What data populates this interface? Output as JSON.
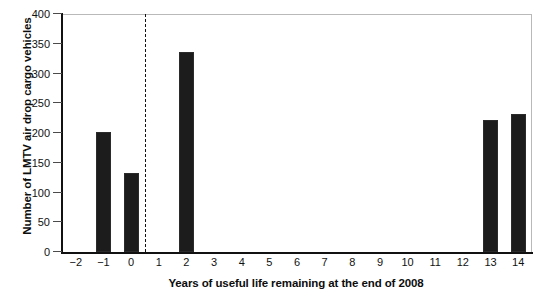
{
  "chart_data": {
    "type": "bar",
    "title": "",
    "xlabel": "Years of useful life remaining at the end of 2008",
    "ylabel": "Number of LMTV air drop cargo vehicles",
    "categories": [
      "-2",
      "-1",
      "0",
      "1",
      "2",
      "3",
      "4",
      "5",
      "6",
      "7",
      "8",
      "9",
      "10",
      "11",
      "12",
      "13",
      "14"
    ],
    "values": [
      0,
      202,
      133,
      0,
      336,
      0,
      0,
      0,
      0,
      0,
      0,
      0,
      0,
      0,
      0,
      222,
      232
    ],
    "xlim": [
      -2.5,
      14.5
    ],
    "ylim": [
      0,
      400
    ],
    "ytick_labels": [
      "0",
      "50",
      "100",
      "150",
      "200",
      "250",
      "300",
      "350",
      "400"
    ],
    "ytick_values": [
      0,
      50,
      100,
      150,
      200,
      250,
      300,
      350,
      400
    ],
    "xtick_labels": [
      "-2",
      "-1",
      "0",
      "1",
      "2",
      "3",
      "4",
      "5",
      "6",
      "7",
      "8",
      "9",
      "10",
      "11",
      "12",
      "13",
      "14"
    ],
    "grid": false,
    "legend": null,
    "annotations": [
      {
        "name": "reference-line",
        "type": "vertical-dashed",
        "x": 0.5
      }
    ],
    "bar_color": "#1c1c1c",
    "axis_color": "#111111",
    "frame_color": "#b9b9b9"
  }
}
